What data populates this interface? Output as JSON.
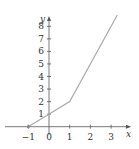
{
  "chart_data": {
    "type": "line",
    "title": "",
    "xlabel": "x",
    "ylabel": "y",
    "x": [
      -1,
      1,
      3.3
    ],
    "series": [
      {
        "name": "f(x)",
        "values": [
          0,
          2,
          8.9
        ]
      }
    ],
    "xticks": [
      -1,
      0,
      1,
      2,
      3
    ],
    "xtick_labels": [
      "−1",
      "0",
      "1",
      "2",
      "3"
    ],
    "yticks": [
      1,
      2,
      3,
      4,
      5,
      6,
      7,
      8
    ],
    "ytick_labels": [
      "1",
      "2",
      "3",
      "4",
      "5",
      "6",
      "7",
      "8"
    ],
    "xlim": [
      -1.6,
      3.9
    ],
    "ylim": [
      0,
      9
    ],
    "grid": false,
    "legend": null,
    "colors": {
      "line": "#aaaaaa",
      "axis": "#444444"
    }
  }
}
